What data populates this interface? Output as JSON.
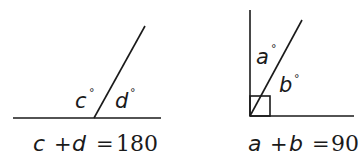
{
  "figures": [
    {
      "id": "supplementary",
      "description": "Two angles on a straight line sum to 180",
      "angles": [
        {
          "var": "c",
          "unit": "°"
        },
        {
          "var": "d",
          "unit": "°"
        }
      ],
      "equation": {
        "lhs_var_1": "c",
        "plus": "+",
        "lhs_var_2": "d",
        "equals": "=",
        "rhs": "180"
      }
    },
    {
      "id": "complementary",
      "description": "Two angles inside a right angle sum to 90",
      "right_angle_marker": true,
      "angles": [
        {
          "var": "a",
          "unit": "°"
        },
        {
          "var": "b",
          "unit": "°"
        }
      ],
      "equation": {
        "lhs_var_1": "a",
        "plus": "+",
        "lhs_var_2": "b",
        "equals": "=",
        "rhs": "90"
      }
    }
  ],
  "colors": {
    "stroke": "#1a1a1a",
    "background": "#ffffff"
  }
}
